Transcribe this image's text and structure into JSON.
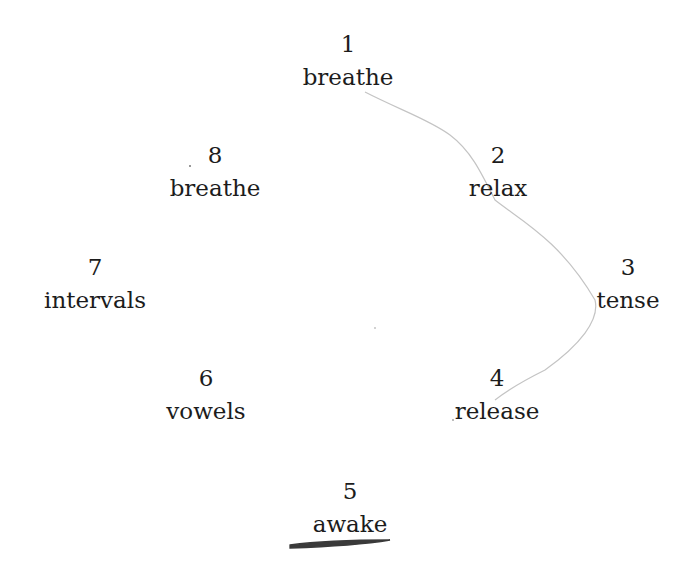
{
  "diagram": {
    "type": "cycle",
    "nodes": [
      {
        "num": "1",
        "label": "breathe"
      },
      {
        "num": "2",
        "label": "relax"
      },
      {
        "num": "3",
        "label": "tense"
      },
      {
        "num": "4",
        "label": "release"
      },
      {
        "num": "5",
        "label": "awake"
      },
      {
        "num": "6",
        "label": "vowels"
      },
      {
        "num": "7",
        "label": "intervals"
      },
      {
        "num": "8",
        "label": "breathe"
      }
    ],
    "annotations": {
      "pencil_path": "1 → 2 → 3 → 4",
      "underlined": "awake"
    },
    "colors": {
      "text": "#1c1c1c",
      "pencil": "#bdbdbd",
      "underline": "#3a3a3a"
    }
  }
}
